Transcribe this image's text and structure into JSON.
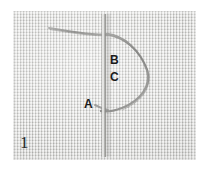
{
  "figure": {
    "number": "1",
    "caption_labels": {
      "a": "A",
      "b": "B",
      "c": "C"
    }
  },
  "scene": {
    "subject": "embroidery-stitch-demonstration",
    "fabric": {
      "name": "woven-aida-cloth",
      "base_color": "#d6d6d3",
      "highlight_color": "#ffffff",
      "shadow_color": "#8e8e8c"
    },
    "needle": {
      "name": "vertical-needle",
      "color": "#b4b4b2",
      "highlight": "#f0f0ee",
      "shadow": "#8a8a88"
    },
    "thread": {
      "name": "working-thread",
      "color": "#9a9a98",
      "shadow": "#7c7c7a"
    }
  },
  "background": {
    "page_color": "#ffffff"
  }
}
